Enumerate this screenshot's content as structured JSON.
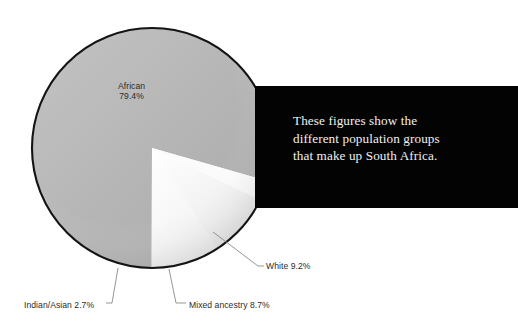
{
  "chart_data": {
    "type": "pie",
    "title": "",
    "subtitle": "",
    "xlabel": "",
    "ylabel": "",
    "unit": "%",
    "legend_position": "none",
    "grid": false,
    "categories": [
      "African",
      "Mixed ancestry",
      "White",
      "Indian/Asian"
    ],
    "values": [
      79.4,
      8.7,
      9.2,
      2.7
    ],
    "slices": [
      {
        "label": "African",
        "value": 79.4,
        "value_text": "79.4%",
        "label_text": "African\n79.4%",
        "color": "#b8b8b8",
        "label_placement": "inside"
      },
      {
        "label": "Mixed ancestry",
        "value": 8.7,
        "value_text": "8.7%",
        "label_text": "Mixed ancestry 8.7%",
        "color": "#f7f7f7",
        "label_placement": "leader-bottom"
      },
      {
        "label": "White",
        "value": 9.2,
        "value_text": "9.2%",
        "label_text": "White 9.2%",
        "color": "#fdfdfd",
        "label_placement": "leader-right"
      },
      {
        "label": "Indian/Asian",
        "value": 2.7,
        "value_text": "2.7%",
        "label_text": "Indian/Asian 2.7%",
        "color": "#fbfbfb",
        "label_placement": "leader-bottom-left"
      }
    ],
    "annotations": [
      {
        "name": "callout",
        "text": "These figures show the different population groups that make up South Africa."
      }
    ]
  },
  "chart": {
    "labels": {
      "african": "African\n79.4%",
      "african_name": "African",
      "african_value": "79.4%",
      "white": "White 9.2%",
      "indian_asian": "Indian/Asian 2.7%",
      "mixed_ancestry": "Mixed ancestry 8.7%"
    }
  },
  "callout": {
    "text": "These figures show the\ndifferent population groups\nthat make up South Africa."
  },
  "colors": {
    "african_slice": "#b8b8b8",
    "minor_slice": "#fafafa",
    "callout_background": "#030303",
    "callout_text": "#f2f0ee",
    "label_text": "#2b2b2b",
    "leader_line": "#7a7a7a",
    "pie_outline": "#141414",
    "page_background": "#ffffff"
  }
}
